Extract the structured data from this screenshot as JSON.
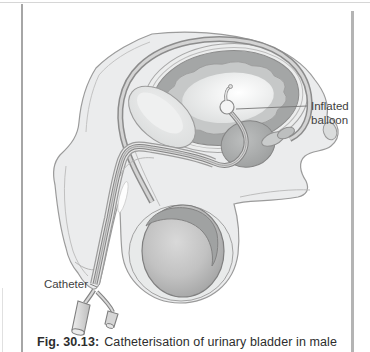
{
  "figure": {
    "caption_label": "Fig. 30.13:",
    "caption_text": "Catheterisation of urinary bladder in male"
  },
  "labels": {
    "inflated_balloon_line1": "Inflated",
    "inflated_balloon_line2": "balloon",
    "catheter": "Catheter"
  },
  "colors": {
    "background": "#ffffff",
    "body_fill": "#ebeced",
    "outline": "#9b9b9b",
    "bladder_wall": "#a4a6a6",
    "bladder_mucosa": "#c6c8c8",
    "bladder_lumen_highlight": "#ffffff",
    "prostate": "#a9abab",
    "testis_edge": "#9d9d9d",
    "catheter_tube": "#888888",
    "label_text": "#3f3f3f",
    "frame_rule": "#b4b4b4"
  }
}
